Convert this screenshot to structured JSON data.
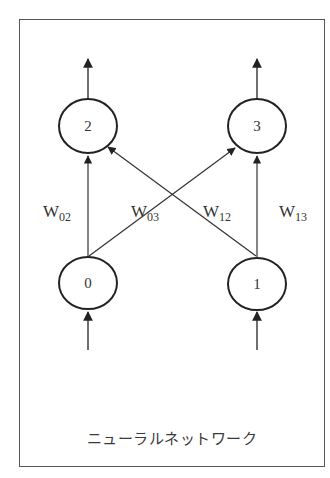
{
  "diagram": {
    "caption": "ニューラルネットワーク",
    "nodes": [
      {
        "id": "0",
        "label": "0",
        "cx": 88,
        "cy": 283
      },
      {
        "id": "1",
        "label": "1",
        "cx": 257,
        "cy": 284
      },
      {
        "id": "2",
        "label": "2",
        "cx": 88,
        "cy": 126
      },
      {
        "id": "3",
        "label": "3",
        "cx": 257,
        "cy": 126
      }
    ],
    "edges": [
      {
        "from": "0",
        "to": "2",
        "weight": {
          "main": "W",
          "sub": "02"
        }
      },
      {
        "from": "0",
        "to": "3",
        "weight": {
          "main": "W",
          "sub": "03"
        }
      },
      {
        "from": "1",
        "to": "2",
        "weight": {
          "main": "W",
          "sub": "12"
        }
      },
      {
        "from": "1",
        "to": "3",
        "weight": {
          "main": "W",
          "sub": "13"
        }
      }
    ],
    "inputs": [
      "0",
      "1"
    ],
    "outputs": [
      "2",
      "3"
    ],
    "colors": {
      "stroke": "#333333",
      "frame": "#555555",
      "background": "#ffffff"
    }
  }
}
